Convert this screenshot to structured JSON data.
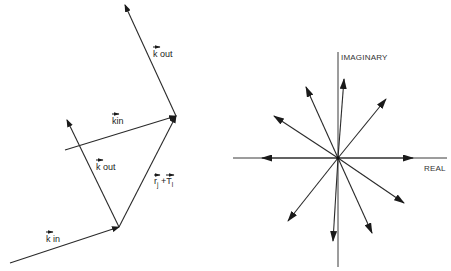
{
  "left_diagram": {
    "title": "Wave vector scattering construction",
    "labels": {
      "k_out_upper": {
        "base": "k",
        "text": " out"
      },
      "k_in_middle": {
        "base": "k",
        "text": "in"
      },
      "k_out_inner": {
        "base": "k",
        "text": " out"
      },
      "k_in_lower": {
        "base": "k",
        "text": " in"
      },
      "position_sum": {
        "r": "r",
        "r_sub": "j",
        "plus": " +",
        "t": "T",
        "t_sub": "l"
      }
    }
  },
  "right_diagram": {
    "title": "Phasor diagram in the complex plane",
    "axis_labels": {
      "imaginary": "IMAGINARY",
      "real": "REAL"
    },
    "phasor_angles_deg": [
      0,
      30,
      37,
      83,
      95,
      118,
      152,
      180,
      220,
      262,
      295,
      330
    ]
  }
}
